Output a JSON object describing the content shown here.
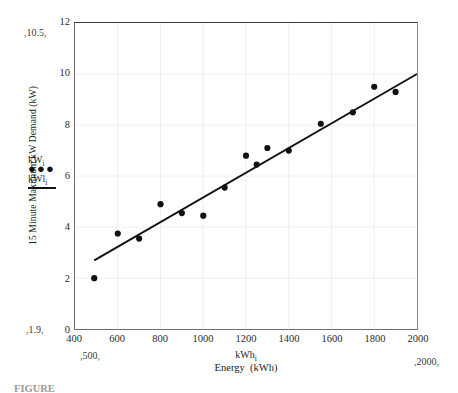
{
  "chart_data": {
    "type": "scatter",
    "title": "",
    "xlabel": "Energy  (kWh)",
    "xlabel_sub": "kWh",
    "xlabel_sub_index": "i",
    "ylabel": "15 Minute Maximum kW Demand (kW)",
    "xlim": [
      400,
      2000
    ],
    "ylim": [
      0,
      12
    ],
    "xticks": [
      400,
      600,
      800,
      1000,
      1200,
      1400,
      1600,
      1800,
      2000
    ],
    "yticks": [
      0,
      2,
      4,
      6,
      8,
      10,
      12
    ],
    "grid": true,
    "legend_position": "left-outside",
    "legend": [
      {
        "label": "kW",
        "sub": "i",
        "marker": "dots"
      },
      {
        "label": "kWl",
        "sub": "i",
        "marker": "line"
      }
    ],
    "x": [
      490,
      600,
      700,
      800,
      900,
      1000,
      1100,
      1200,
      1250,
      1300,
      1400,
      1550,
      1700,
      1800,
      1900
    ],
    "y": [
      2.0,
      3.75,
      3.55,
      4.9,
      4.55,
      4.45,
      5.55,
      6.8,
      6.45,
      7.1,
      7.0,
      8.05,
      8.5,
      9.5,
      9.3
    ],
    "fit_line": {
      "type": "linear",
      "x0": 490,
      "y0": 2.7,
      "x1": 2000,
      "y1": 10.0
    },
    "annotations": [
      {
        "name": "y-top-note",
        "text": "10.5"
      },
      {
        "name": "y-bottom-note",
        "text": "1.9"
      },
      {
        "name": "x-left-note",
        "text": "500"
      },
      {
        "name": "x-right-note",
        "text": "2000"
      }
    ]
  },
  "caption": "FIGURE"
}
